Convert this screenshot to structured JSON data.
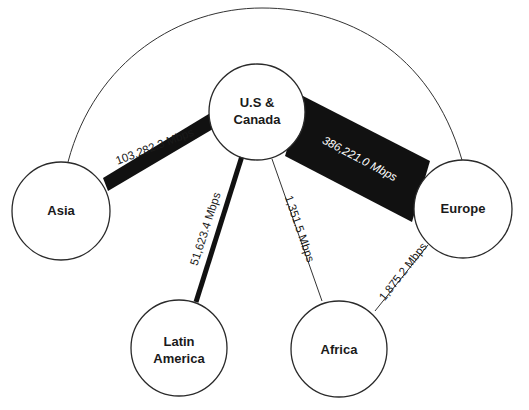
{
  "diagram": {
    "nodes": [
      {
        "id": "us_canada",
        "label_lines": [
          "U.S &",
          "Canada"
        ]
      },
      {
        "id": "asia",
        "label_lines": [
          "Asia"
        ]
      },
      {
        "id": "europe",
        "label_lines": [
          "Europe"
        ]
      },
      {
        "id": "latin_america",
        "label_lines": [
          "Latin",
          "America"
        ]
      },
      {
        "id": "africa",
        "label_lines": [
          "Africa"
        ]
      }
    ],
    "links": [
      {
        "from": "us_canada",
        "to": "europe",
        "label": "386,221.0 Mbps",
        "value_mbps": 386221.0
      },
      {
        "from": "us_canada",
        "to": "asia",
        "label": "103,282.3 Mbps",
        "value_mbps": 103282.3
      },
      {
        "from": "us_canada",
        "to": "latin_america",
        "label": "51,623.4 Mbps",
        "value_mbps": 51623.4
      },
      {
        "from": "europe",
        "to": "africa",
        "label": "1,875.2 Mbps",
        "value_mbps": 1875.2
      },
      {
        "from": "us_canada",
        "to": "africa",
        "label": "1,351.5 Mbps",
        "value_mbps": 1351.5
      },
      {
        "from": "asia",
        "to": "europe",
        "label": "",
        "style": "arc"
      }
    ],
    "colors": {
      "stroke": "#2a2a2a",
      "fill_thick": "#111111",
      "node_fill": "#ffffff"
    }
  }
}
